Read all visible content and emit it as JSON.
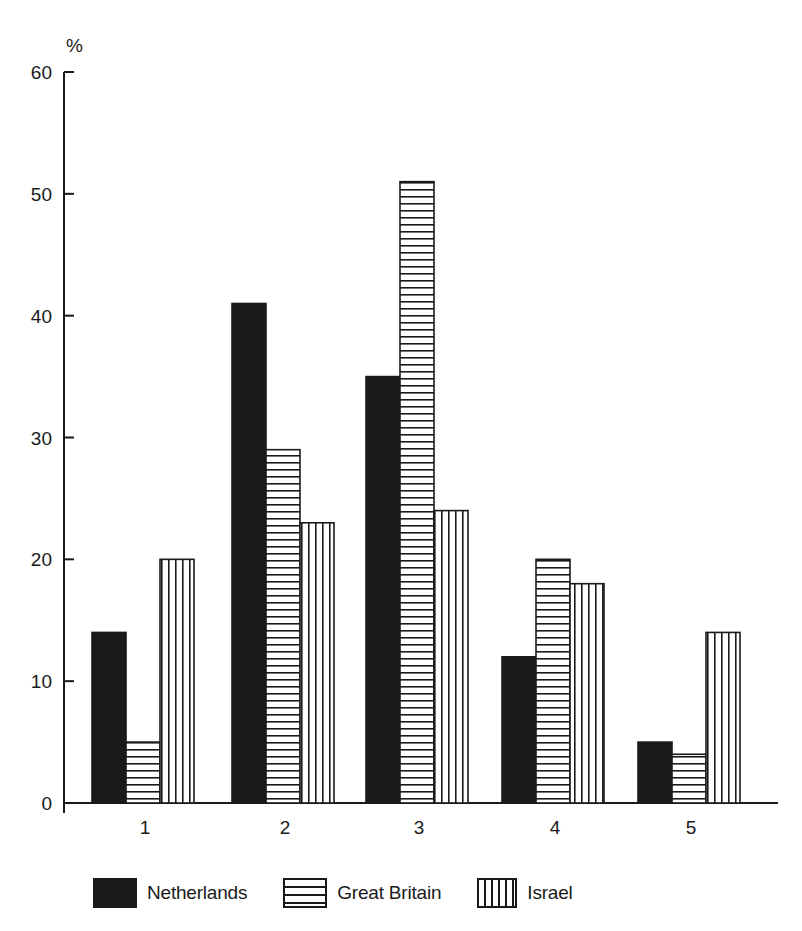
{
  "chart_data": {
    "type": "bar",
    "title": "",
    "xlabel": "",
    "ylabel": "%",
    "ylim": [
      0,
      60
    ],
    "yticks": [
      0,
      10,
      20,
      30,
      40,
      50,
      60
    ],
    "categories": [
      "1",
      "2",
      "3",
      "4",
      "5"
    ],
    "series": [
      {
        "name": "Netherlands",
        "pattern": "solid",
        "color": "#1a1a1a",
        "values": [
          14,
          41,
          35,
          12,
          5
        ]
      },
      {
        "name": "Great Britain",
        "pattern": "horizontal-lines",
        "color": "#1a1a1a",
        "values": [
          5,
          29,
          51,
          20,
          4
        ]
      },
      {
        "name": "Israel",
        "pattern": "vertical-lines",
        "color": "#1a1a1a",
        "values": [
          20,
          23,
          24,
          18,
          14
        ]
      }
    ],
    "grid": false,
    "legend_position": "bottom"
  },
  "legend": {
    "items": [
      {
        "label": "Netherlands"
      },
      {
        "label": "Great Britain"
      },
      {
        "label": "Israel"
      }
    ]
  }
}
